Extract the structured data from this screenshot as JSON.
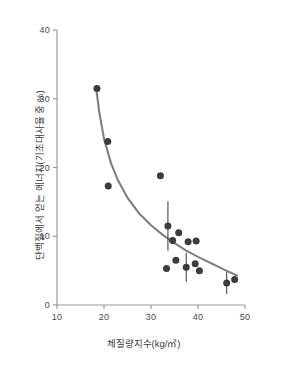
{
  "chart_data": {
    "type": "scatter",
    "title": "",
    "xlabel": "체질량지수(kg/㎡)",
    "ylabel": "단백질에서 얻는 에너지(기초대사율 중 %)",
    "xlim": [
      10,
      50
    ],
    "ylim": [
      0,
      40
    ],
    "xticks": [
      10,
      20,
      30,
      40,
      50
    ],
    "yticks": [
      0,
      10,
      20,
      30,
      40
    ],
    "xtick_labels": [
      "10",
      "20",
      "30",
      "40",
      "50"
    ],
    "ytick_labels": [
      "0",
      "10",
      "20",
      "30",
      "40"
    ],
    "grid": false,
    "legend": null,
    "marker_color": "#3c3c3c",
    "curve_color": "#808080",
    "axis_color": "#9a9a9a",
    "points": [
      {
        "x": 18.5,
        "y": 31.5,
        "err": 0
      },
      {
        "x": 20.8,
        "y": 23.8,
        "err": 0
      },
      {
        "x": 20.9,
        "y": 17.3,
        "err": 0
      },
      {
        "x": 32.0,
        "y": 18.8,
        "err": 0
      },
      {
        "x": 33.6,
        "y": 11.5,
        "err": 3.6
      },
      {
        "x": 33.3,
        "y": 5.3,
        "err": 0
      },
      {
        "x": 34.6,
        "y": 9.4,
        "err": 0
      },
      {
        "x": 35.3,
        "y": 6.5,
        "err": 0
      },
      {
        "x": 35.9,
        "y": 10.5,
        "err": 0
      },
      {
        "x": 37.5,
        "y": 5.5,
        "err": 2.1
      },
      {
        "x": 37.9,
        "y": 9.2,
        "err": 0
      },
      {
        "x": 39.4,
        "y": 6.0,
        "err": 0
      },
      {
        "x": 39.6,
        "y": 9.3,
        "err": 0
      },
      {
        "x": 40.3,
        "y": 5.0,
        "err": 0
      },
      {
        "x": 46.1,
        "y": 3.2,
        "err": 1.6
      },
      {
        "x": 47.8,
        "y": 3.7,
        "err": 0
      }
    ],
    "fit_curve": {
      "description": "decreasing power/exponential trend line",
      "x": [
        18.4,
        19.0,
        20.0,
        21.5,
        23.0,
        25.0,
        27.5,
        30.0,
        32.5,
        35.0,
        37.5,
        40.0,
        43.0,
        46.0,
        48.3
      ],
      "y": [
        31.2,
        28.0,
        24.2,
        20.6,
        18.1,
        15.6,
        13.3,
        11.6,
        10.2,
        9.0,
        7.9,
        7.0,
        6.0,
        5.0,
        4.3
      ]
    }
  }
}
